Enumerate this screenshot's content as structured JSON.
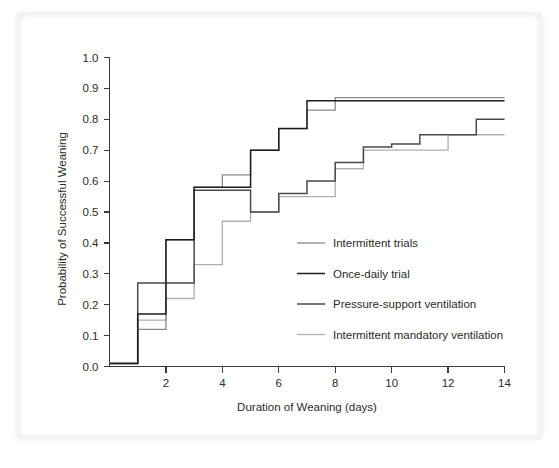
{
  "chart_data": {
    "type": "line",
    "title": "",
    "xlabel": "Duration of Weaning (days)",
    "ylabel": "Probability of Successful Weaning",
    "xlim": [
      0,
      14
    ],
    "ylim": [
      0.0,
      1.0
    ],
    "xticks": [
      2,
      4,
      6,
      8,
      10,
      12,
      14
    ],
    "xtick_labels": [
      "2",
      "4",
      "6",
      "8",
      "10",
      "12",
      "14"
    ],
    "yticks": [
      0.0,
      0.1,
      0.2,
      0.3,
      0.4,
      0.5,
      0.6,
      0.7,
      0.8,
      0.9,
      1.0
    ],
    "ytick_labels": [
      "0.0",
      "0.1",
      "0.2",
      "0.3",
      "0.4",
      "0.5",
      "0.6",
      "0.7",
      "0.8",
      "0.9",
      "1.0"
    ],
    "grid": false,
    "legend_position": "center-right",
    "interpolation": "step-after",
    "series": [
      {
        "name": "Intermittent trials",
        "color": "#8a8a8a",
        "width": 1.3,
        "x": [
          0,
          0.75,
          1,
          2,
          3,
          4,
          5,
          6,
          7,
          8,
          9,
          10,
          11,
          12,
          13,
          14
        ],
        "y": [
          0.01,
          0.01,
          0.12,
          0.41,
          0.58,
          0.62,
          0.7,
          0.77,
          0.83,
          0.87,
          0.87,
          0.87,
          0.87,
          0.87,
          0.87,
          0.87
        ]
      },
      {
        "name": "Once-daily trial",
        "color": "#1d1d1d",
        "width": 1.5,
        "x": [
          0,
          0.75,
          1,
          2,
          3,
          4,
          5,
          6,
          7,
          8,
          9,
          10,
          11,
          12,
          13,
          14
        ],
        "y": [
          0.01,
          0.01,
          0.17,
          0.41,
          0.58,
          0.58,
          0.7,
          0.77,
          0.86,
          0.86,
          0.86,
          0.86,
          0.86,
          0.86,
          0.86,
          0.86
        ]
      },
      {
        "name": "Pressure-support ventilation",
        "color": "#4a4a4a",
        "width": 1.5,
        "x": [
          0,
          0.75,
          1,
          2,
          3,
          4,
          5,
          6,
          7,
          8,
          9,
          10,
          11,
          12,
          13,
          14
        ],
        "y": [
          0.01,
          0.01,
          0.27,
          0.27,
          0.57,
          0.57,
          0.5,
          0.56,
          0.6,
          0.66,
          0.71,
          0.72,
          0.75,
          0.75,
          0.8,
          0.8
        ]
      },
      {
        "name": "Intermittent mandatory ventilation",
        "color": "#b0b0b0",
        "width": 1.3,
        "x": [
          0,
          0.75,
          1,
          2,
          3,
          4,
          5,
          6,
          7,
          8,
          9,
          10,
          11,
          12,
          13,
          14
        ],
        "y": [
          0.01,
          0.01,
          0.15,
          0.22,
          0.33,
          0.47,
          0.5,
          0.55,
          0.55,
          0.64,
          0.7,
          0.7,
          0.7,
          0.75,
          0.75,
          0.75
        ]
      }
    ],
    "series_order_drawn": [
      3,
      2,
      0,
      1
    ],
    "legend_entries": [
      {
        "label": "Intermittent trials",
        "color": "#8a8a8a"
      },
      {
        "label": "Once-daily trial",
        "color": "#1d1d1d"
      },
      {
        "label": "Pressure-support ventilation",
        "color": "#4a4a4a"
      },
      {
        "label": "Intermittent mandatory ventilation",
        "color": "#b0b0b0"
      }
    ]
  }
}
